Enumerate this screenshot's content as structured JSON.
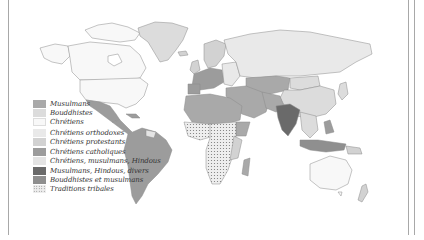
{
  "figure": {
    "title": "",
    "type": "world religions choropleth map"
  },
  "colors": {
    "background": "#ffffff",
    "border": "#a8a8a8",
    "coast": "#8a8a8a",
    "musulmans": "#a9a9a9",
    "bouddhistes": "#dcdcdc",
    "chretiens": "#f8f8f8",
    "chretiens_orthodoxes": "#e9e9e9",
    "chretiens_protestants": "#d2d2d2",
    "chretiens_catholiques": "#9c9c9c",
    "chretiens_musulmans_hindous": "#e4e4e4",
    "musulmans_hindous_divers": "#6a6a6a",
    "bouddhistes_et_musulmans": "#8f8f8f",
    "traditions_tribales": "#eeeeee"
  },
  "legend": {
    "items": [
      {
        "label": "Musulmans",
        "color": "#a9a9a9",
        "pattern": "solid"
      },
      {
        "label": "Bouddhistes",
        "color": "#dcdcdc",
        "pattern": "solid"
      },
      {
        "label": "Chrétiens",
        "color": "#f8f8f8",
        "pattern": "solid"
      },
      {
        "label": "Chrétiens orthodoxes",
        "color": "#e9e9e9",
        "pattern": "solid"
      },
      {
        "label": "Chrétiens protestants",
        "color": "#d2d2d2",
        "pattern": "solid"
      },
      {
        "label": "Chrétiens catholiques",
        "color": "#9c9c9c",
        "pattern": "solid"
      },
      {
        "label": "Chrétiens, musulmans, Hindous",
        "color": "#e4e4e4",
        "pattern": "solid"
      },
      {
        "label": "Musulmans, Hindous, divers",
        "color": "#6a6a6a",
        "pattern": "solid"
      },
      {
        "label": "Bouddhistes et musulmans",
        "color": "#8f8f8f",
        "pattern": "solid"
      },
      {
        "label": "Traditions tribales",
        "color": "#eeeeee",
        "pattern": "dotted"
      }
    ]
  }
}
